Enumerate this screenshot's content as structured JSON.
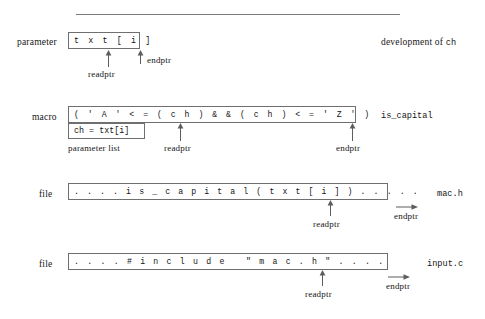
{
  "figure": {
    "line_color": "#7a7a7a",
    "text_color": "#161616"
  },
  "top_rule": {
    "name": "top-horizontal-rule"
  },
  "sections": [
    {
      "id": "parameter",
      "row_label": "parameter",
      "code": "t x t [ i ]",
      "caption_prefix": "development of ",
      "caption_mono": "ch",
      "pointers": [
        {
          "name": "readptr",
          "label": "readptr",
          "kind": "up-arrow"
        },
        {
          "name": "endptr",
          "label": "endptr",
          "kind": "up-arrow"
        }
      ]
    },
    {
      "id": "macro",
      "row_label": "macro",
      "code_line1": "( ' A ' < = ( c h ) & & ( c h ) < = ' Z ' )",
      "code_line2": "ch = txt[i]",
      "parameter_list_label": "parameter list",
      "caption_mono": "is_capital",
      "pointers": [
        {
          "name": "readptr",
          "label": "readptr",
          "kind": "up-arrow"
        },
        {
          "name": "endptr",
          "label": "endptr",
          "kind": "up-arrow"
        }
      ]
    },
    {
      "id": "mac-h",
      "row_label": "file",
      "code": ". . . . i s _ c a p i t a l ( t x t [ i ] ) . . . . .",
      "caption_mono": "mac.h",
      "pointers": [
        {
          "name": "readptr",
          "label": "readptr",
          "kind": "up-arrow"
        },
        {
          "name": "endptr",
          "label": "endptr",
          "kind": "right-arrow"
        }
      ]
    },
    {
      "id": "input-c",
      "row_label": "file",
      "code": ". . . . # i n c l u d e   \" m a c . h \" . . . .",
      "caption_mono": "input.c",
      "pointers": [
        {
          "name": "readptr",
          "label": "readptr",
          "kind": "up-arrow"
        },
        {
          "name": "endptr",
          "label": "endptr",
          "kind": "right-arrow"
        }
      ]
    }
  ]
}
